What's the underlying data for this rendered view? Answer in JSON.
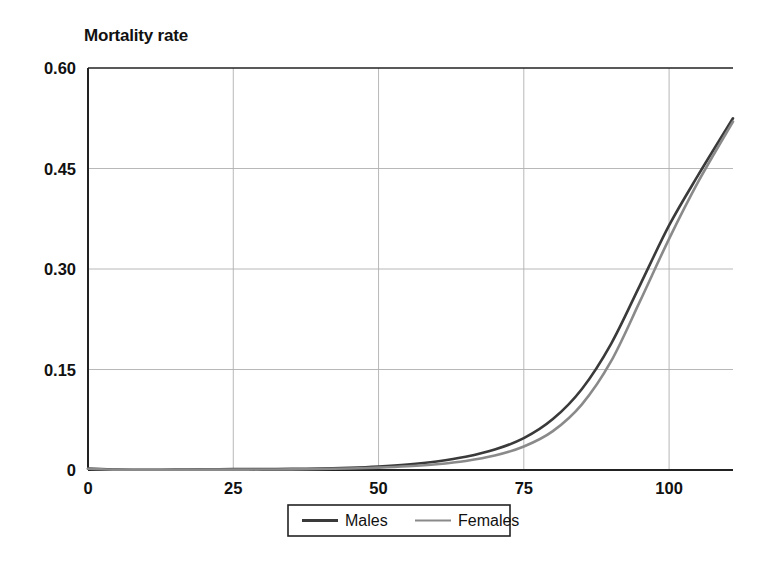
{
  "chart_data": {
    "type": "line",
    "title": "Mortality rate",
    "xlabel": "",
    "ylabel": "Mortality rate",
    "xlim": [
      0,
      111
    ],
    "ylim": [
      0,
      0.6
    ],
    "grid": true,
    "legend_position": "bottom-center",
    "xticks": [
      0,
      25,
      50,
      75,
      100
    ],
    "xtick_labels": [
      "0",
      "25",
      "50",
      "75",
      "100"
    ],
    "yticks": [
      0,
      0.15,
      0.3,
      0.45,
      0.6
    ],
    "ytick_labels": [
      "0",
      "0.15",
      "0.30",
      "0.45",
      "0.60"
    ],
    "x": [
      0,
      5,
      10,
      15,
      20,
      25,
      30,
      35,
      40,
      45,
      50,
      55,
      60,
      65,
      70,
      75,
      80,
      85,
      90,
      95,
      100,
      105,
      111
    ],
    "series": [
      {
        "name": "Males",
        "color": "#3a3a3a",
        "values": [
          0.002,
          0.0005,
          0.0004,
          0.0006,
          0.0011,
          0.0013,
          0.0014,
          0.0017,
          0.0022,
          0.0033,
          0.0052,
          0.0082,
          0.0128,
          0.0197,
          0.0305,
          0.0475,
          0.076,
          0.121,
          0.188,
          0.276,
          0.365,
          0.44,
          0.525
        ]
      },
      {
        "name": "Females",
        "color": "#8a8a8a",
        "values": [
          0.0018,
          0.0004,
          0.0003,
          0.0004,
          0.0005,
          0.0005,
          0.0007,
          0.001,
          0.0015,
          0.0023,
          0.0036,
          0.0056,
          0.0086,
          0.0134,
          0.0215,
          0.035,
          0.058,
          0.098,
          0.162,
          0.252,
          0.345,
          0.43,
          0.52
        ]
      }
    ]
  },
  "legend": {
    "entries": [
      {
        "label": "Males",
        "color": "#3a3a3a"
      },
      {
        "label": "Females",
        "color": "#8a8a8a"
      }
    ]
  },
  "colors": {
    "axis": "#222222",
    "grid": "#b0b0b0",
    "background": "#ffffff",
    "males_line": "#3a3a3a",
    "females_line": "#8a8a8a"
  }
}
